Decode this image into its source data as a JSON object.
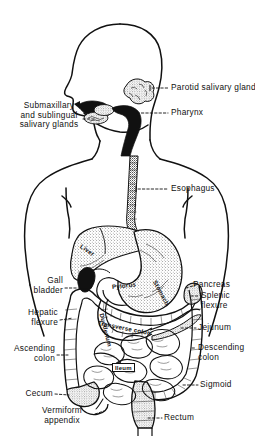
{
  "figure": {
    "ink_color": "#111111",
    "background_color": "#ffffff"
  },
  "callout_labels": {
    "parotid": "Parotid salivary gland",
    "submaxillary": "Submaxillary\nand sublingual\nsalivary glands",
    "pharynx": "Pharynx",
    "esophagus": "Esophagus",
    "gall_bladder": "Gall\nbladder",
    "hepatic_flexure": "Hepatic\nflexure",
    "ascending_colon": "Ascending\ncolon",
    "cecum": "Cecum",
    "vermiform_appendix": "Vermiform\nappendix",
    "pancreas": "Pancreas",
    "splenic_flexure": "Splenic\nflexure",
    "jejunum": "Jejunum",
    "descending_colon": "Descending\ncolon",
    "sigmoid": "Sigmoid",
    "rectum": "Rectum"
  },
  "organ_labels": {
    "liver": "Liver",
    "pylorus": "Pylorus",
    "stomach": "Stomach",
    "duodenum": "Duodenum",
    "transverse_colon": "Transverse colon",
    "ileum": "Ileum"
  }
}
